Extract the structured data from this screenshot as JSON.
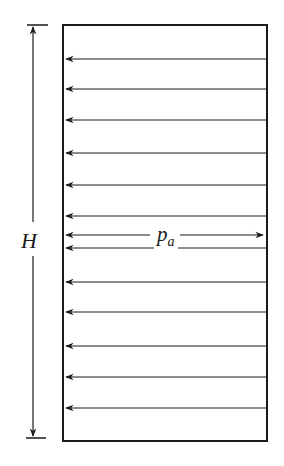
{
  "diagram": {
    "labels": {
      "height": "H",
      "pressure_main": "p",
      "pressure_sub": "a"
    },
    "wall": {
      "x": 63,
      "y": 25,
      "width": 204,
      "height": 416
    },
    "dimension_line": {
      "x": 33,
      "top": 25,
      "bottom": 438
    },
    "arrow_rows_y": [
      59,
      89,
      120,
      153,
      185,
      216,
      248,
      282,
      312,
      346,
      377,
      408
    ],
    "pa_arrow_y": 235,
    "colors": {
      "stroke": "#1a1a1a",
      "background": "#ffffff"
    }
  }
}
